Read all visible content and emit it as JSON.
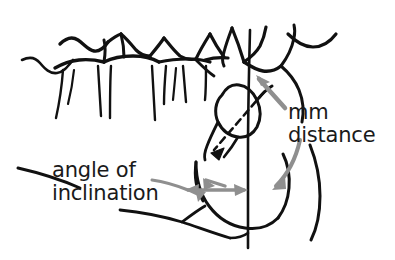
{
  "figure": {
    "background_color": "#ffffff",
    "width": 395,
    "height": 260
  },
  "colors": {
    "tracing_stroke": "#111111",
    "annotation_arrow": "#8f8f8f",
    "label_text": "#1a1a1a"
  },
  "annotations": {
    "mm_distance": {
      "line1": "mm",
      "line2": "distance",
      "arrow_icon": "curved-arrow-down-icon",
      "arrow_icon_2": "straight-arrow-up-left-icon"
    },
    "angle_of_inclination": {
      "line1": "angle of",
      "line2": "inclination",
      "arrow_icon": "double-headed-arrow-icon"
    }
  },
  "tracing": {
    "strokes": [
      {
        "name": "maxillary-alveolar-crest-left",
        "d": "M 22 60 C 30 56 36 58 40 63 C 45 69 50 74 57 73 C 64 72 68 66 73 60"
      },
      {
        "name": "molar-crown-1-outline",
        "d": "M 60 44 C 66 38 72 36 78 40 C 84 44 88 50 94 51 C 100 52 104 48 108 42"
      },
      {
        "name": "molar-crown-1-cervical",
        "d": "M 55 68 C 62 64 70 61 79 60 C 88 59 96 60 104 62"
      },
      {
        "name": "molar-1-distal-wall",
        "d": "M 104 40 C 106 48 105 56 104 62"
      },
      {
        "name": "molar-1-root-mesial",
        "d": "M 63 70 C 62 84 60 100 56 118"
      },
      {
        "name": "molar-1-root-distal",
        "d": "M 98 66 C 99 82 100 98 101 116"
      },
      {
        "name": "molar-2-crown-outline",
        "d": "M 104 62 C 112 58 122 56 133 56 C 143 56 152 58 159 62"
      },
      {
        "name": "molar-2-cusp-ridge",
        "d": "M 121 34 C 123 42 124 50 124 57"
      },
      {
        "name": "molar-2-mesial-slope",
        "d": "M 108 42 C 113 38 118 35 121 34"
      },
      {
        "name": "molar-2-distal-slope",
        "d": "M 121 34 C 126 38 131 44 136 50 C 140 54 145 56 150 56"
      },
      {
        "name": "molar-2-root-mesial",
        "d": "M 111 66 C 110 82 110 98 110 118"
      },
      {
        "name": "molar-2-root-distal",
        "d": "M 152 66 C 153 84 154 100 155 120"
      },
      {
        "name": "molar-3-crown-left-slope",
        "d": "M 150 56 C 155 50 160 44 164 38"
      },
      {
        "name": "molar-3-crown-right-slope",
        "d": "M 164 38 C 169 44 174 51 180 56 C 185 59 191 60 196 59"
      },
      {
        "name": "molar-3-cervical-line",
        "d": "M 159 62 C 168 60 178 59 188 59 C 196 59 204 60 210 62"
      },
      {
        "name": "molar-3-root-mesial",
        "d": "M 166 66 C 165 78 164 90 164 104"
      },
      {
        "name": "molar-3-root-distal",
        "d": "M 183 66 C 184 78 185 90 186 102"
      },
      {
        "name": "molar-3-root-extra",
        "d": "M 176 68 C 175 80 174 90 173 100"
      },
      {
        "name": "molar-4-crown-left-slope",
        "d": "M 196 59 C 200 50 205 42 210 34"
      },
      {
        "name": "molar-4-crown-right-slope",
        "d": "M 210 34 C 214 42 219 50 224 57"
      },
      {
        "name": "molar-4-cervical",
        "d": "M 205 60 C 212 58 220 57 228 58"
      },
      {
        "name": "molar-4-root",
        "d": "M 206 66 C 206 78 206 90 205 100"
      },
      {
        "name": "second-molar-distal-curve",
        "d": "M 196 60 C 202 66 208 72 214 74"
      },
      {
        "name": "last-erupted-molar-crown",
        "d": "M 232 28 C 237 40 241 52 244 62"
      },
      {
        "name": "last-erupted-molar-crown-distal",
        "d": "M 244 62 C 250 58 256 53 260 46 C 263 40 265 33 266 27"
      },
      {
        "name": "last-erupted-molar-mesial-curve",
        "d": "M 232 28 C 229 36 226 44 224 52 C 222 58 222 62 224 66"
      },
      {
        "name": "retromolar-curve",
        "d": "M 244 62 C 250 66 256 70 263 71 C 270 72 276 70 281 66"
      },
      {
        "name": "coronoid-process-curve",
        "d": "M 288 34 C 296 42 304 47 313 47 C 322 47 330 42 336 34"
      },
      {
        "name": "ramus-anterior-border",
        "d": "M 281 66 C 287 58 292 48 294 38 C 295 33 295 29 294 25"
      },
      {
        "name": "ramus-anterior-lower",
        "d": "M 281 66 C 288 72 295 80 299 90 C 303 100 304 112 302 122"
      },
      {
        "name": "ramus-posterior-border",
        "d": "M 310 145 C 316 160 320 178 320 196 C 320 212 317 228 311 240"
      },
      {
        "name": "impacted-molar-outline",
        "d": "M 222 95 C 226 88 232 84 239 85 C 247 86 253 92 257 100 C 261 109 261 119 257 127 C 253 134 246 138 238 137 C 229 136 222 130 218 122 C 214 113 215 102 222 95 Z"
      },
      {
        "name": "impacted-molar-crown-tip",
        "d": "M 257 100 C 262 94 267 89 272 86"
      },
      {
        "name": "impacted-molar-root-taper",
        "d": "M 218 122 C 214 130 210 138 207 146 C 205 151 204 156 205 160"
      },
      {
        "name": "impacted-molar-root-taper-2",
        "d": "M 238 137 C 234 144 229 151 224 157"
      },
      {
        "name": "impacted-molar-long-axis-dashed",
        "d": "M 264 92 L 212 152",
        "dash": "7 5"
      },
      {
        "name": "impacted-molar-axis-arrowhead",
        "d": "M 212 152 L 222 147 L 219 157 Z",
        "fill": true
      },
      {
        "name": "vertical-reference-line",
        "d": "M 250 30 C 249 70 248 110 248 150 C 248 190 248 220 248 248"
      },
      {
        "name": "mandible-body-inferior-border",
        "d": "M 196 162 C 196 178 200 194 209 206 C 218 218 231 226 245 228 C 258 230 270 226 278 218"
      },
      {
        "name": "mandible-angle-curve",
        "d": "M 278 218 C 284 210 288 200 289 188 C 290 176 288 164 283 154"
      },
      {
        "name": "mandibular-canal-arc",
        "d": "M 196 162 C 194 176 196 190 203 201"
      },
      {
        "name": "mandibular-plane-line",
        "d": "M 18 168 C 40 173 62 180 80 188"
      },
      {
        "name": "mandible-lower-border-left",
        "d": "M 120 210 C 140 212 162 216 182 222 C 200 228 216 234 230 238"
      },
      {
        "name": "antegonial-notch",
        "d": "M 182 222 C 190 216 198 210 205 206"
      },
      {
        "name": "gonial-tick",
        "d": "M 230 238 C 238 238 244 236 248 233"
      }
    ]
  }
}
